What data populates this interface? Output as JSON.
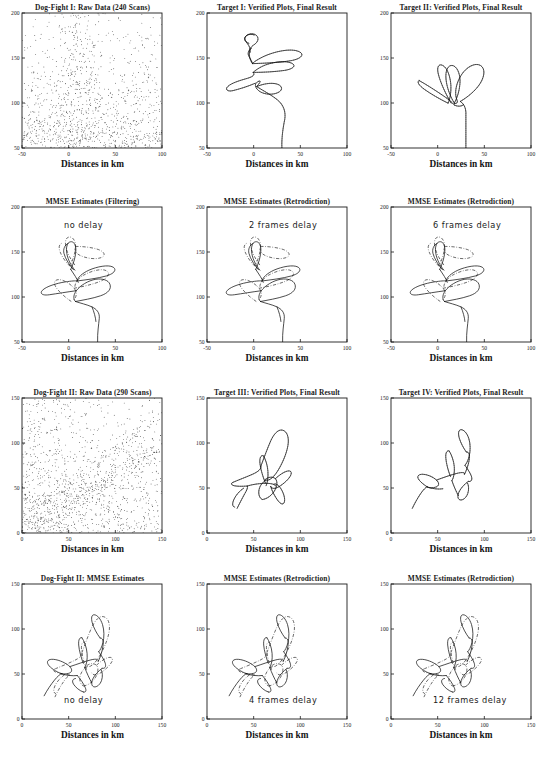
{
  "figure": {
    "caption_present": false,
    "axis_label_x": "Distances in km",
    "n_rows": 4,
    "n_cols": 3
  },
  "chart_data": [
    {
      "id": "r1c1",
      "type": "scatter",
      "title": "Dog-Fight I: Raw Data (240 Scans)",
      "xlabel": "Distances in km",
      "ylabel": "",
      "xlim": [
        -50,
        100
      ],
      "ylim": [
        50,
        200
      ],
      "xticks": [
        -50,
        0,
        50,
        100
      ],
      "yticks": [
        50,
        100,
        150,
        200
      ],
      "grid": false,
      "legend": "none",
      "annotation": "",
      "series": [
        {
          "name": "raw plots (clutter + targets)",
          "style": "points",
          "n_points": 2400
        }
      ]
    },
    {
      "id": "r1c2",
      "type": "line",
      "title": "Target I: Verified Plots, Final Result",
      "xlabel": "Distances in km",
      "ylabel": "",
      "xlim": [
        -50,
        100
      ],
      "ylim": [
        50,
        200
      ],
      "xticks": [
        -50,
        0,
        50,
        100
      ],
      "yticks": [
        50,
        100,
        150,
        200
      ],
      "grid": false,
      "legend": "none",
      "annotation": "",
      "series": [
        {
          "name": "verified plots track",
          "style": "dotted-line"
        }
      ]
    },
    {
      "id": "r1c3",
      "type": "line",
      "title": "Target II: Verified Plots, Final Result",
      "xlabel": "Distances in km",
      "ylabel": "",
      "xlim": [
        -50,
        100
      ],
      "ylim": [
        50,
        200
      ],
      "xticks": [
        -50,
        0,
        50,
        100
      ],
      "yticks": [
        50,
        100,
        150,
        200
      ],
      "grid": false,
      "legend": "none",
      "annotation": "",
      "series": [
        {
          "name": "verified plots track",
          "style": "dotted-line"
        }
      ]
    },
    {
      "id": "r2c1",
      "type": "line",
      "title": "MMSE Estimates (Filtering)",
      "xlabel": "Distances in km",
      "ylabel": "",
      "xlim": [
        -50,
        100
      ],
      "ylim": [
        50,
        200
      ],
      "xticks": [
        -50,
        0,
        50,
        100
      ],
      "yticks": [
        50,
        100,
        150,
        200
      ],
      "grid": false,
      "legend": "none",
      "annotation": "no delay",
      "series": [
        {
          "name": "target I estimate",
          "style": "solid"
        },
        {
          "name": "target II estimate",
          "style": "dash-dot"
        }
      ]
    },
    {
      "id": "r2c2",
      "type": "line",
      "title": "MMSE Estimates (Retrodiction)",
      "xlabel": "Distances in km",
      "ylabel": "",
      "xlim": [
        -50,
        100
      ],
      "ylim": [
        50,
        200
      ],
      "xticks": [
        -50,
        0,
        50,
        100
      ],
      "yticks": [
        50,
        100,
        150,
        200
      ],
      "grid": false,
      "legend": "none",
      "annotation": "2 frames delay",
      "series": [
        {
          "name": "target I estimate",
          "style": "solid"
        },
        {
          "name": "target II estimate",
          "style": "dash-dot"
        }
      ]
    },
    {
      "id": "r2c3",
      "type": "line",
      "title": "MMSE Estimates (Retrodiction)",
      "xlabel": "Distances in km",
      "ylabel": "",
      "xlim": [
        -50,
        100
      ],
      "ylim": [
        50,
        200
      ],
      "xticks": [
        -50,
        0,
        50,
        100
      ],
      "yticks": [
        50,
        100,
        150,
        200
      ],
      "grid": false,
      "legend": "none",
      "annotation": "6 frames delay",
      "series": [
        {
          "name": "target I estimate",
          "style": "solid"
        },
        {
          "name": "target II estimate",
          "style": "dash-dot"
        }
      ]
    },
    {
      "id": "r3c1",
      "type": "scatter",
      "title": "Dog-Fight II: Raw Data (290 Scans)",
      "xlabel": "Distances in km",
      "ylabel": "",
      "xlim": [
        0,
        150
      ],
      "ylim": [
        0,
        150
      ],
      "xticks": [
        0,
        50,
        100,
        150
      ],
      "yticks": [
        0,
        50,
        100,
        150
      ],
      "grid": false,
      "legend": "none",
      "annotation": "",
      "series": [
        {
          "name": "raw plots (clutter + targets)",
          "style": "points",
          "n_points": 2900
        }
      ]
    },
    {
      "id": "r3c2",
      "type": "line",
      "title": "Target III: Verified Plots, Final Result",
      "xlabel": "Distances in km",
      "ylabel": "",
      "xlim": [
        0,
        150
      ],
      "ylim": [
        0,
        150
      ],
      "xticks": [
        0,
        50,
        100,
        150
      ],
      "yticks": [
        0,
        50,
        100,
        150
      ],
      "grid": false,
      "legend": "none",
      "annotation": "",
      "series": [
        {
          "name": "verified plots track",
          "style": "dotted-line"
        }
      ]
    },
    {
      "id": "r3c3",
      "type": "line",
      "title": "Target IV: Verified Plots, Final Result",
      "xlabel": "Distances in km",
      "ylabel": "",
      "xlim": [
        0,
        150
      ],
      "ylim": [
        0,
        150
      ],
      "xticks": [
        0,
        50,
        100,
        150
      ],
      "yticks": [
        0,
        50,
        100,
        150
      ],
      "grid": false,
      "legend": "none",
      "annotation": "",
      "series": [
        {
          "name": "verified plots track",
          "style": "dotted-line"
        }
      ]
    },
    {
      "id": "r4c1",
      "type": "line",
      "title": "Dog-Fight II: MMSE Estimates",
      "xlabel": "Distances in km",
      "ylabel": "",
      "xlim": [
        0,
        150
      ],
      "ylim": [
        0,
        150
      ],
      "xticks": [
        0,
        50,
        100,
        150
      ],
      "yticks": [
        0,
        50,
        100,
        150
      ],
      "grid": false,
      "legend": "none",
      "annotation": "no delay",
      "series": [
        {
          "name": "target III estimate",
          "style": "solid"
        },
        {
          "name": "target IV estimate",
          "style": "dash-dot"
        }
      ]
    },
    {
      "id": "r4c2",
      "type": "line",
      "title": "MMSE Estimates (Retrodiction)",
      "xlabel": "Distances in km",
      "ylabel": "",
      "xlim": [
        0,
        150
      ],
      "ylim": [
        0,
        150
      ],
      "xticks": [
        0,
        50,
        100,
        150
      ],
      "yticks": [
        0,
        50,
        100,
        150
      ],
      "grid": false,
      "legend": "none",
      "annotation": "4 frames delay",
      "series": [
        {
          "name": "target III estimate",
          "style": "solid"
        },
        {
          "name": "target IV estimate",
          "style": "dash-dot"
        }
      ]
    },
    {
      "id": "r4c3",
      "type": "line",
      "title": "MMSE Estimates (Retrodiction)",
      "xlabel": "Distances in km",
      "ylabel": "",
      "xlim": [
        0,
        150
      ],
      "ylim": [
        0,
        150
      ],
      "xticks": [
        0,
        50,
        100,
        150
      ],
      "yticks": [
        0,
        50,
        100,
        150
      ],
      "grid": false,
      "legend": "none",
      "annotation": "12 frames delay",
      "series": [
        {
          "name": "target III estimate",
          "style": "solid"
        },
        {
          "name": "target IV estimate",
          "style": "dash-dot"
        }
      ]
    }
  ]
}
